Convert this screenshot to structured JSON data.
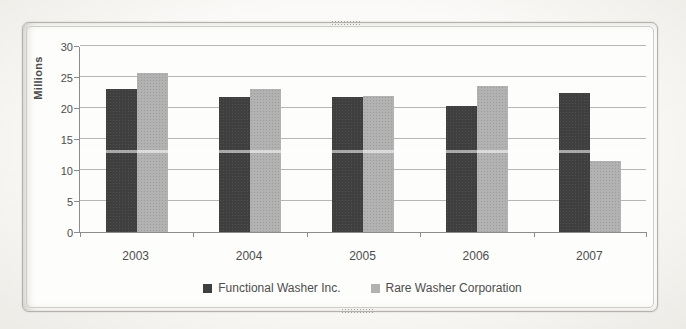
{
  "chart_data": {
    "type": "bar",
    "title": "",
    "xlabel": "",
    "ylabel": "Millions",
    "categories": [
      "2003",
      "2004",
      "2005",
      "2006",
      "2007"
    ],
    "series": [
      {
        "name": "Functional Washer Inc.",
        "color": "#3f3f3f",
        "values": [
          23,
          21.8,
          21.7,
          20.4,
          22.4
        ]
      },
      {
        "name": "Rare Washer Corporation",
        "color": "#b2b2b2",
        "values": [
          25.6,
          23,
          21.9,
          23.6,
          11.4
        ]
      }
    ],
    "ylim": [
      0,
      30
    ],
    "yticks": [
      0,
      5,
      10,
      15,
      20,
      25,
      30
    ],
    "grid": true,
    "legend_position": "bottom"
  },
  "colors": {
    "dark_series": "#3f3f3f",
    "light_series": "#b2b2b2",
    "gridline": "#9e9e9e",
    "axis_line": "#8c8c8c",
    "text": "#4d4d4d",
    "frame_border": "#b3b1ac",
    "page_background": "#f4f2ee"
  }
}
